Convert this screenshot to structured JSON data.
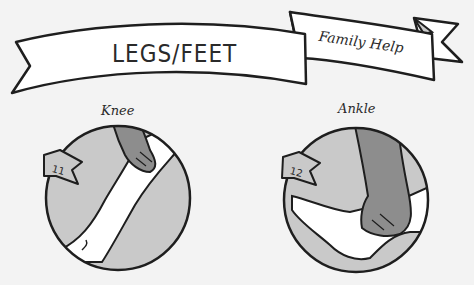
{
  "banner": {
    "title": "LEGS/FEET",
    "subtitle": "Family Help"
  },
  "cards": [
    {
      "label": "Knee",
      "number": "11",
      "icon": "knee-hand-icon"
    },
    {
      "label": "Ankle",
      "number": "12",
      "icon": "ankle-hand-icon"
    }
  ],
  "colors": {
    "background": "#f3f3f3",
    "circle_fill": "#c9c9c9",
    "hand": "#8d8d8d",
    "skin": "#ffffff",
    "outline": "#1e1e1e"
  }
}
